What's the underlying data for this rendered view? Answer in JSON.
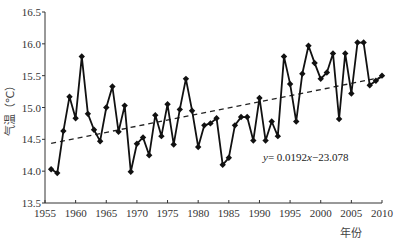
{
  "chart_data": {
    "type": "line",
    "title": "",
    "xlabel": "年份",
    "ylabel": "气温（℃）",
    "xlim": [
      1955,
      2010
    ],
    "ylim": [
      13.5,
      16.5
    ],
    "x_ticks": [
      1955,
      1960,
      1965,
      1970,
      1975,
      1980,
      1985,
      1990,
      1995,
      2000,
      2005,
      2010
    ],
    "y_ticks": [
      "13.5",
      "14.0",
      "14.5",
      "15.0",
      "15.5",
      "16.0",
      "16.5"
    ],
    "grid": false,
    "legend": null,
    "series": [
      {
        "name": "年平均气温",
        "style": "solid line with diamond markers",
        "x": [
          1956,
          1957,
          1958,
          1959,
          1960,
          1961,
          1962,
          1963,
          1964,
          1965,
          1966,
          1967,
          1968,
          1969,
          1970,
          1971,
          1972,
          1973,
          1974,
          1975,
          1976,
          1977,
          1978,
          1979,
          1980,
          1981,
          1982,
          1983,
          1984,
          1985,
          1986,
          1987,
          1988,
          1989,
          1990,
          1991,
          1992,
          1993,
          1994,
          1995,
          1996,
          1997,
          1998,
          1999,
          2000,
          2001,
          2002,
          2003,
          2004,
          2005,
          2006,
          2007,
          2008,
          2009,
          2010
        ],
        "values": [
          14.03,
          13.97,
          14.63,
          15.17,
          14.83,
          15.8,
          14.9,
          14.65,
          14.47,
          15.0,
          15.33,
          14.62,
          15.03,
          13.99,
          14.43,
          14.53,
          14.25,
          14.88,
          14.55,
          15.05,
          14.42,
          14.97,
          15.45,
          14.95,
          14.38,
          14.72,
          14.75,
          14.83,
          14.1,
          14.21,
          14.72,
          14.85,
          14.85,
          14.48,
          15.15,
          14.48,
          14.78,
          14.55,
          15.8,
          15.37,
          14.78,
          15.53,
          15.97,
          15.7,
          15.45,
          15.55,
          15.85,
          14.82,
          15.85,
          15.22,
          16.02,
          16.02,
          15.35,
          15.42,
          15.5
        ]
      },
      {
        "name": "线性趋势",
        "style": "dashed line",
        "x": [
          1956,
          2010
        ],
        "values": [
          14.4372,
          15.474
        ]
      }
    ],
    "annotations": [
      {
        "text": "y= 0.0192x−23.078",
        "x": 1991,
        "y": 14.18
      }
    ]
  }
}
